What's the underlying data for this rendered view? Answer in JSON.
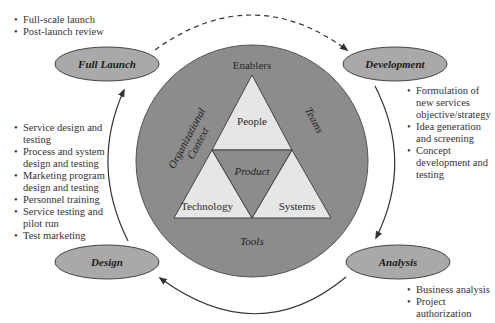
{
  "diagram": {
    "stages": [
      {
        "id": "full-launch",
        "label": "Full Launch",
        "bullets": [
          "Full-scale launch",
          "Post-launch review"
        ]
      },
      {
        "id": "development",
        "label": "Development",
        "bullets": [
          "Formulation of new services objective/strategy",
          "Idea generation and screening",
          "Concept development and testing"
        ]
      },
      {
        "id": "analysis",
        "label": "Analysis",
        "bullets": [
          "Business analysis",
          "Project authorization"
        ]
      },
      {
        "id": "design",
        "label": "Design",
        "bullets": [
          "Service design and testing",
          "Process and system design and testing",
          "Marketing program design and testing",
          "Personnel training",
          "Service testing and pilot run",
          "Test marketing"
        ]
      }
    ],
    "center": {
      "top_label": "Enablers",
      "left_label_line1": "Organizational",
      "left_label_line2": "Context",
      "right_label": "Teams",
      "bottom_label": "Tools",
      "triangles": {
        "top": "People",
        "center": "Product",
        "left": "Technology",
        "right": "Systems"
      }
    },
    "colors": {
      "ellipse_fill": "#a9a9a9",
      "circle_fill": "#8c8c8c",
      "triangle_fill": "#e6e6e6",
      "line": "#333333"
    }
  }
}
